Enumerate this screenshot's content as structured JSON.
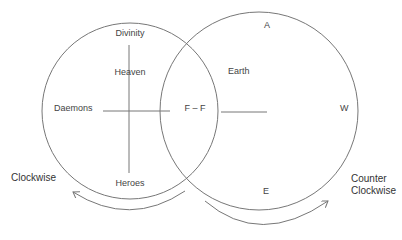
{
  "diagram": {
    "left_circle": {
      "top": "Divinity",
      "upper": "Heaven",
      "left": "Daemons",
      "bottom": "Heroes"
    },
    "intersection": "F – F",
    "right_circle": {
      "top": "A",
      "upper_left": "Earth",
      "right": "W",
      "bottom": "E"
    },
    "left_arrow_label": "Clockwise",
    "right_arrow_label_line1": "Counter",
    "right_arrow_label_line2": "Clockwise",
    "colors": {
      "stroke": "#777777",
      "text": "#444444",
      "background": "#ffffff"
    }
  }
}
